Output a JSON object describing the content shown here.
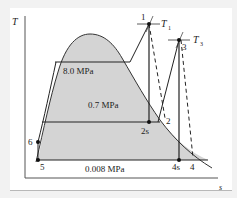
{
  "diagram": {
    "type": "T-s diagram",
    "axes": {
      "y_label": "T",
      "x_label": "s"
    },
    "pressure_lines": [
      {
        "label": "8.0 MPa"
      },
      {
        "label": "0.7 MPa"
      },
      {
        "label": "0.008 MPa"
      }
    ],
    "state_points": [
      {
        "label": "1"
      },
      {
        "label": "2"
      },
      {
        "label": "2s"
      },
      {
        "label": "3"
      },
      {
        "label": "4"
      },
      {
        "label": "4s"
      },
      {
        "label": "5"
      },
      {
        "label": "6"
      }
    ],
    "temperature_labels": {
      "t1": "T",
      "t1_sub": "1",
      "t3": "T",
      "t3_sub": "3"
    },
    "colors": {
      "dome_fill": "#d4d4d4",
      "line": "#222222",
      "background": "#ffffff",
      "page": "#f2f2f2"
    }
  }
}
